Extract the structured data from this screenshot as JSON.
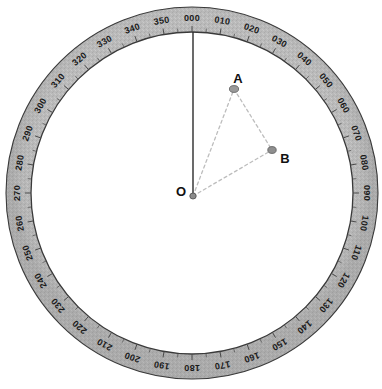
{
  "diagram": {
    "type": "compass-rose",
    "background_color": "#ffffff"
  },
  "compass": {
    "center": {
      "x": 192,
      "y": 193
    },
    "outer_radius": 186,
    "inner_radius": 161,
    "ring_fill_color": "#b5b5b5",
    "ring_edge_color": "#3a3a3a",
    "label_color": "#1a1a1a",
    "label_font_size": 9,
    "tick_color": "#4a4a4a",
    "degree_step": 10,
    "tick_step": 5,
    "north_at_top_degrees": 0,
    "labels": [
      "000",
      "010",
      "020",
      "030",
      "040",
      "050",
      "060",
      "070",
      "080",
      "090",
      "100",
      "110",
      "120",
      "130",
      "140",
      "150",
      "160",
      "170",
      "180",
      "190",
      "200",
      "210",
      "220",
      "230",
      "240",
      "250",
      "260",
      "270",
      "280",
      "290",
      "300",
      "310",
      "320",
      "330",
      "340",
      "350"
    ]
  },
  "reference_line": {
    "name": "north-reference-line",
    "from_degrees": 0,
    "color": "#2b2b2b",
    "width": 1.4
  },
  "points": [
    {
      "id": "O",
      "label": "O",
      "role": "origin",
      "x": 193,
      "y": 196,
      "label_x": 181,
      "label_y": 191,
      "marker_rx": 3.2,
      "marker_ry": 3.0,
      "marker_color": "#8c8c8c",
      "marker_stroke": "#555555",
      "label_font_size": 13
    },
    {
      "id": "A",
      "label": "A",
      "role": "target",
      "x": 234,
      "y": 89,
      "label_x": 238,
      "label_y": 78,
      "bearing": "018",
      "marker_rx": 4.6,
      "marker_ry": 3.4,
      "marker_color": "#9a9a9a",
      "marker_stroke": "#6a6a6a",
      "label_font_size": 13
    },
    {
      "id": "B",
      "label": "B",
      "role": "target",
      "x": 272,
      "y": 150,
      "label_x": 285,
      "label_y": 158,
      "bearing": "051",
      "marker_rx": 4.2,
      "marker_ry": 3.4,
      "marker_color": "#8f8f8f",
      "marker_stroke": "#636363",
      "label_font_size": 13
    }
  ],
  "bearing_lines": [
    {
      "id": "OA",
      "from": "O",
      "to": "A",
      "style": "dashed",
      "color": "#bdbdbd"
    },
    {
      "id": "AB",
      "from": "A",
      "to": "B",
      "style": "dashed",
      "color": "#bdbdbd"
    },
    {
      "id": "OB",
      "from": "O",
      "to": "B",
      "style": "dashed",
      "color": "#bdbdbd"
    }
  ]
}
